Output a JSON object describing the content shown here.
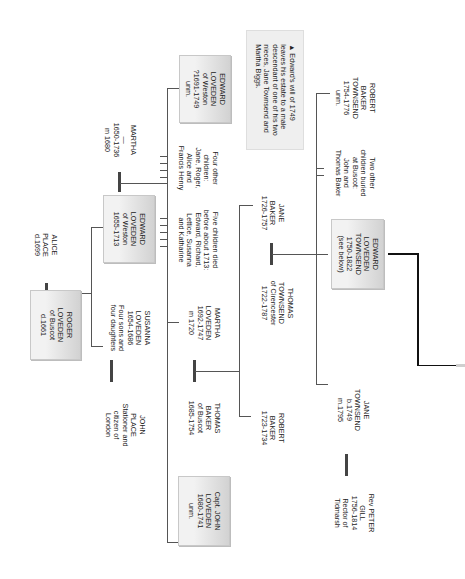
{
  "diagram": {
    "orientation": "rotated 90 degrees clockwise",
    "people": {
      "martha_sr": {
        "text": "MARTHA\n—\n1650-1736\nm 1680"
      },
      "alice_place": {
        "text": "ALICE\nPLACE\nd.1699"
      },
      "roger": {
        "text": "ROGER\nLOVEDEN\nof Buscot\nd.1661"
      },
      "john_place": {
        "text": "JOHN\nPLACE\nStationer and\ncitizen of\nLondon"
      },
      "edward_weston_1655": {
        "text": "EDWARD\nLOVEDEN\nof Weston\n1655-1713"
      },
      "susanna": {
        "text": "SUSANNA\nLOVEDEN\n1654-1686\nFour sons and\nfour daughters"
      },
      "five_children": {
        "text": "Five children died\nbefore about 1713:\nEdward, Richard,\nLettice, Susanna\nand Katharine"
      },
      "four_children": {
        "text": "Four other\nchildren:\nJane, Roger,\nAlice and\nFrancis Henry"
      },
      "edward_weston_1691": {
        "text": "EDWARD\nLOVEDEN\nof Weston\n?1691-1749\nunm."
      },
      "will_note": {
        "text": "▲ Edward's will of 1749\nleaves his estate to a male\ndescendant of one of his two\nnieces, Jane Townsend and\nMartha Biggs."
      },
      "martha_loveden": {
        "text": "MARTHA\nLOVEDEN\n1692-1747\nm 1720"
      },
      "thomas_baker": {
        "text": "THOMAS\nBAKER\nof Buscot\n1685-1754"
      },
      "capt_john": {
        "text": "Capt. JOHN\nLOVEDEN\n1680-1741\nunm."
      },
      "robert_baker": {
        "text": "ROBERT\nBAKER\n1723-1734"
      },
      "thomas_townsend": {
        "text": "THOMAS\nTOWNSEND\nof Cirencester\n1722-1787"
      },
      "jane_baker": {
        "text": "JANE\nBAKER\n1726-1757"
      },
      "edward_townsend": {
        "text": "EDWARD\nLOVEDEN\nTOWNSEND\n1750-1822\n(see below)"
      },
      "two_children": {
        "text": "Two other\nchildren buried\nat Buscot:\nJohn and\nThomas Baker"
      },
      "robert_baker_townsend": {
        "text": "ROBERT\nBAKER\nTOWNSEND\n1754-1776\nunm."
      },
      "jane_townsend": {
        "text": "JANE\nTOWNSEND\nb.1749\nm.1795"
      },
      "peter_gill": {
        "text": "Rev PETER\nGILL\n1756-1814\nRector of\nTidmarsh"
      }
    }
  }
}
